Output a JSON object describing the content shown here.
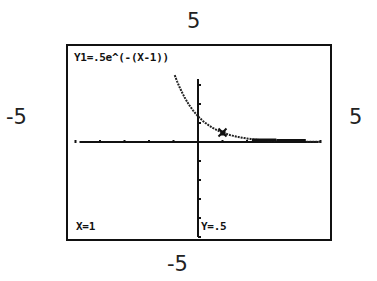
{
  "window": {
    "xmin": "-5",
    "xmax": "5",
    "ymin": "-5",
    "ymax": "5"
  },
  "screen": {
    "function_label": "Y1=.5e^(-(X-1))",
    "cursor_x_label": "X=1",
    "cursor_y_label": "Y=.5"
  },
  "chart_data": {
    "type": "line",
    "title": "Y1=.5e^(-(X-1))",
    "xlabel": "",
    "ylabel": "",
    "xlim": [
      -5,
      5
    ],
    "ylim": [
      -5,
      5
    ],
    "grid": false,
    "tick_spacing": 1,
    "series": [
      {
        "name": "Y1",
        "expression": "0.5*e^(-(x-1))",
        "x": [
          -1.0,
          -0.5,
          0.0,
          0.5,
          1.0,
          1.5,
          2.0,
          3.0,
          4.0,
          5.0
        ],
        "values": [
          3.69,
          2.24,
          1.36,
          0.82,
          0.5,
          0.3,
          0.18,
          0.07,
          0.02,
          0.01
        ]
      }
    ],
    "trace_cursor": {
      "x": 1,
      "y": 0.5
    },
    "annotations": [
      "X=1",
      "Y=.5"
    ]
  }
}
